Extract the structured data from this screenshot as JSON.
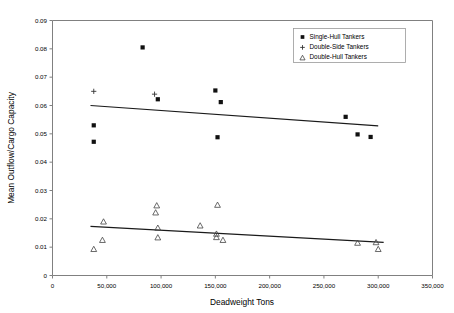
{
  "chart_data": {
    "type": "scatter",
    "title": "",
    "xlabel": "Deadweight Tons",
    "ylabel": "Mean Outflow/Cargo Capacity",
    "xlim": [
      0,
      350000
    ],
    "ylim": [
      0,
      0.09
    ],
    "grid": false,
    "legend_position": "top-right",
    "xticks": [
      0,
      50000,
      100000,
      150000,
      200000,
      250000,
      300000,
      350000
    ],
    "xticklabels": [
      "0",
      "50,000",
      "100,000",
      "150,000",
      "200,000",
      "250,000",
      "300,000",
      "350,000"
    ],
    "yticks": [
      0,
      0.01,
      0.02,
      0.03,
      0.04,
      0.05,
      0.06,
      0.07,
      0.08,
      0.09
    ],
    "yticklabels": [
      "0",
      "0.01",
      "0.02",
      "0.03",
      "0.04",
      "0.05",
      "0.06",
      "0.07",
      "0.08",
      "0.09"
    ],
    "series": [
      {
        "name": "Single-Hull Tankers",
        "marker": "square",
        "points": [
          [
            38000,
            0.053
          ],
          [
            38000,
            0.0472
          ],
          [
            83000,
            0.0805
          ],
          [
            97000,
            0.0622
          ],
          [
            150000,
            0.0653
          ],
          [
            155000,
            0.0612
          ],
          [
            152000,
            0.0488
          ],
          [
            270000,
            0.056
          ],
          [
            281000,
            0.0498
          ],
          [
            293000,
            0.0489
          ]
        ]
      },
      {
        "name": "Double-Side Tankers",
        "marker": "plus",
        "points": [
          [
            38000,
            0.065
          ],
          [
            94000,
            0.064
          ]
        ]
      },
      {
        "name": "Double-Hull Tankers",
        "marker": "triangle",
        "points": [
          [
            38000,
            0.0093
          ],
          [
            47000,
            0.019
          ],
          [
            46000,
            0.0125
          ],
          [
            96000,
            0.0247
          ],
          [
            95000,
            0.0222
          ],
          [
            97000,
            0.0168
          ],
          [
            97000,
            0.0134
          ],
          [
            136000,
            0.0176
          ],
          [
            152000,
            0.0249
          ],
          [
            151000,
            0.0147
          ],
          [
            151000,
            0.0135
          ],
          [
            157000,
            0.0125
          ],
          [
            281000,
            0.0115
          ],
          [
            298000,
            0.0117
          ],
          [
            300000,
            0.0093
          ]
        ]
      }
    ],
    "trendlines": [
      {
        "name": "single-hull-trend",
        "for_series": "Single-Hull Tankers",
        "x": [
          35000,
          300000
        ],
        "y": [
          0.06,
          0.0528
        ]
      },
      {
        "name": "double-hull-trend",
        "for_series": "Double-Hull Tankers",
        "x": [
          35000,
          305000
        ],
        "y": [
          0.0173,
          0.0117
        ]
      }
    ]
  },
  "legend": {
    "items": [
      {
        "label": "Single-Hull Tankers",
        "marker": "square"
      },
      {
        "label": "Double-Side Tankers",
        "marker": "plus"
      },
      {
        "label": "Double-Hull Tankers",
        "marker": "triangle"
      }
    ]
  }
}
